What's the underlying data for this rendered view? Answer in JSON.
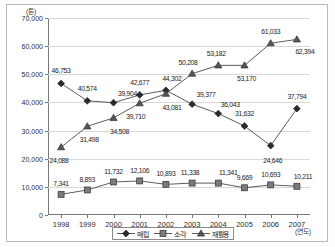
{
  "chart_data": {
    "type": "line",
    "title": "",
    "xlabel": "(연도)",
    "ylabel": "(톤)",
    "x": [
      "1998",
      "1999",
      "2000",
      "2001",
      "2002",
      "2003",
      "2004",
      "2005",
      "2006",
      "2007"
    ],
    "categories": [
      "1998",
      "1999",
      "2000",
      "2001",
      "2002",
      "2003",
      "2004",
      "2005",
      "2006",
      "2007"
    ],
    "ylim": [
      0,
      70000
    ],
    "yticks": [
      0,
      10000,
      20000,
      30000,
      40000,
      50000,
      60000,
      70000
    ],
    "ytick_labels": [
      "0",
      "10,000",
      "20,000",
      "30,000",
      "40,000",
      "50,000",
      "60,000",
      "70,000"
    ],
    "grid": true,
    "legend_position": "bottom",
    "series": [
      {
        "name": "매립",
        "marker": "diamond",
        "color": "#2b2b2b",
        "values": [
          46753,
          40574,
          39904,
          42677,
          44302,
          39377,
          36043,
          31632,
          24646,
          37794
        ],
        "labels": [
          "46,753",
          "40,574",
          "39,904",
          "42,677",
          "44,302",
          "39,377",
          "36,043",
          "31,632",
          "24,646",
          "37,794"
        ]
      },
      {
        "name": "소각",
        "marker": "square",
        "color": "#7a7a7a",
        "values": [
          7341,
          8893,
          11732,
          12106,
          10893,
          11338,
          11341,
          9669,
          10693,
          10211
        ],
        "labels": [
          "7,341",
          "8,893",
          "11,732",
          "12,106",
          "10,893",
          "11,338",
          "11,341",
          "9,669",
          "10,693",
          "10,211"
        ]
      },
      {
        "name": "재활용",
        "marker": "triangle",
        "color": "#555555",
        "values": [
          24088,
          31498,
          34508,
          39710,
          43081,
          50208,
          53182,
          53170,
          61033,
          62394
        ],
        "labels": [
          "24,088",
          "31,498",
          "34,508",
          "39,710",
          "43,081",
          "50,208",
          "53,182",
          "53,170",
          "61,033",
          "62,394"
        ]
      }
    ]
  },
  "axes": {
    "y_unit_label": "(톤)",
    "x_unit_label": "(연도)"
  }
}
